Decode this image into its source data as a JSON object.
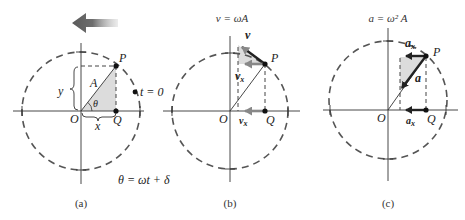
{
  "figure": {
    "arrow_direction": "counterclockwise (leftward)",
    "panels": [
      {
        "caption": "(a)",
        "labels": {
          "P": "P",
          "Q": "Q",
          "O": "O",
          "A": "A",
          "x": "x",
          "y": "y",
          "theta": "θ",
          "t0": "t = 0"
        },
        "equation": "θ = ωt + δ"
      },
      {
        "caption": "(b)",
        "title": "v = ωA",
        "labels": {
          "P": "P",
          "Q": "Q",
          "O": "O",
          "v": "v",
          "vx_top": "v",
          "vx_top_sub": "x",
          "vx_bottom": "v",
          "vx_bottom_sub": "x"
        }
      },
      {
        "caption": "(c)",
        "title": "a = ω² A",
        "labels": {
          "P": "P",
          "Q": "Q",
          "O": "O",
          "a": "a",
          "ax_top": "a",
          "ax_top_sub": "x",
          "ax_bottom": "a",
          "ax_bottom_sub": "x"
        }
      }
    ],
    "colors": {
      "shade": "#dcdcdc",
      "vector_dark": "#222222",
      "vector_gray": "#888888",
      "circle": "#555555"
    }
  }
}
